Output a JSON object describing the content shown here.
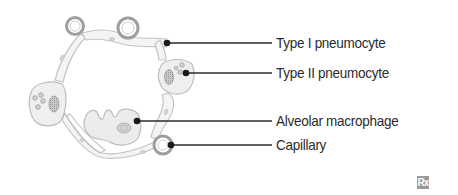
{
  "diagram": {
    "labels": [
      {
        "text": "Type I pneumocyte",
        "y": 43
      },
      {
        "text": "Type II pneumocyte",
        "y": 73
      },
      {
        "text": "Alveolar macrophage",
        "y": 121
      },
      {
        "text": "Capillary",
        "y": 145
      }
    ],
    "colors": {
      "outline": "#bdbdbd",
      "cell_fill": "#efefef",
      "nucleus": "#a8a8a8",
      "leader": "#2b2b2b",
      "text": "#2b2b2b"
    }
  },
  "logo": {
    "text": "Rx",
    "color": "#9a9a9a"
  }
}
